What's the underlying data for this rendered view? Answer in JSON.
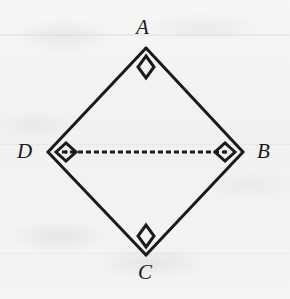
{
  "figure": {
    "shape_name": "square",
    "background_color": "#f3f3f3",
    "stroke_color": "#1a1a1a",
    "stroke_width": 3,
    "labels": {
      "top": "A",
      "right": "B",
      "bottom": "C",
      "left": "D"
    },
    "vertices": [
      {
        "name": "A",
        "x": 146,
        "y": 48,
        "right_angle_marker": true,
        "marker_dot": false
      },
      {
        "name": "B",
        "x": 243,
        "y": 152,
        "right_angle_marker": true,
        "marker_dot": true
      },
      {
        "name": "C",
        "x": 146,
        "y": 255,
        "right_angle_marker": true,
        "marker_dot": false
      },
      {
        "name": "D",
        "x": 48,
        "y": 152,
        "right_angle_marker": true,
        "marker_dot": true
      }
    ],
    "edges": [
      {
        "name": "AB",
        "from": "A",
        "to": "B",
        "style": "solid"
      },
      {
        "name": "BC",
        "from": "B",
        "to": "C",
        "style": "solid"
      },
      {
        "name": "CD",
        "from": "C",
        "to": "D",
        "style": "solid"
      },
      {
        "name": "DA",
        "from": "D",
        "to": "A",
        "style": "solid"
      }
    ],
    "diagonals": [
      {
        "name": "DB",
        "from": "D",
        "to": "B",
        "style": "dashed",
        "dash_length": 5,
        "dash_gap": 3,
        "stroke_width": 3
      }
    ],
    "right_angle_marker": {
      "shape": "diamond",
      "size": 11,
      "filled": false,
      "center_dot_radius": 1.6
    }
  }
}
